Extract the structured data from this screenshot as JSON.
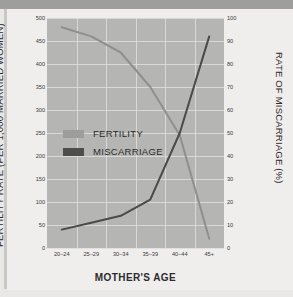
{
  "chart_data": {
    "type": "line",
    "title": "",
    "xlabel": "MOTHER'S AGE",
    "categories": [
      "20–24",
      "25–29",
      "30–34",
      "35–39",
      "40–44",
      "45+"
    ],
    "grid": true,
    "legend_position": "inside-left",
    "axes": {
      "left": {
        "label": "FERTILITY RATE (PER 1,000 MARRIED WOMEN)",
        "ylim": [
          0,
          500
        ],
        "ticks": [
          0,
          50,
          100,
          150,
          200,
          250,
          300,
          350,
          400,
          450,
          500
        ]
      },
      "right": {
        "label": "RATE OF MISCARRIAGE (%)",
        "ylim": [
          0,
          100
        ],
        "ticks": [
          0,
          10,
          20,
          30,
          40,
          50,
          60,
          70,
          80,
          90,
          100
        ]
      }
    },
    "series": [
      {
        "name": "FERTILITY",
        "axis": "left",
        "color": "#8f8f8d",
        "values": [
          480,
          460,
          425,
          350,
          245,
          20
        ]
      },
      {
        "name": "MISCARRIAGE",
        "axis": "right",
        "color": "#4a4a4a",
        "values": [
          8,
          11,
          14,
          21,
          50,
          92
        ]
      }
    ]
  },
  "legend": {
    "items": [
      {
        "label": "FERTILITY",
        "color": "#9d9d9a"
      },
      {
        "label": "MISCARRIAGE",
        "color": "#4d4d4d"
      }
    ]
  },
  "colors": {
    "page_background": "#e9e8e6",
    "plot_background": "#b5b5b3",
    "gridline": "#dedede",
    "top_bar": "#9e9e9c",
    "text": "#2c2c2c"
  }
}
